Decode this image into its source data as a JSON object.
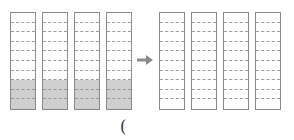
{
  "diagram": {
    "left_group": {
      "bars": [
        {
          "segments": 10,
          "filled": 3
        },
        {
          "segments": 10,
          "filled": 3
        },
        {
          "segments": 10,
          "filled": 3
        },
        {
          "segments": 10,
          "filled": 3
        }
      ],
      "fill_color": "#cfcfcf"
    },
    "arrow": "arrow-right",
    "right_group": {
      "bars": [
        {
          "segments": 10,
          "filled": 0
        },
        {
          "segments": 10,
          "filled": 0
        },
        {
          "segments": 10,
          "filled": 0
        },
        {
          "segments": 10,
          "filled": 0
        }
      ]
    },
    "caption": "("
  }
}
